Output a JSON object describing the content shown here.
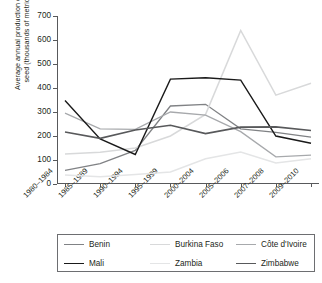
{
  "chart_data": {
    "type": "line",
    "title": "",
    "xlabel": "",
    "ylabel": "Average annual production of cotton\nseed (thousands of metric tons)",
    "ylim": [
      0,
      700
    ],
    "yticks": [
      0,
      100,
      200,
      300,
      400,
      500,
      600,
      700
    ],
    "grid": false,
    "legend_position": "below",
    "categories": [
      "1980–1984",
      "1985–1989",
      "1990–1994",
      "1995–1999",
      "2000–2004",
      "2005–2006",
      "2007–2008",
      "2009–2010"
    ],
    "series": [
      {
        "name": "Benin",
        "color": "#808285",
        "width": 1.3,
        "values": [
          57,
          85,
          140,
          325,
          332,
          230,
          215,
          195
        ]
      },
      {
        "name": "Burkina Faso",
        "color": "#d8d9da",
        "width": 1.5,
        "values": [
          125,
          132,
          150,
          200,
          290,
          640,
          370,
          420
        ]
      },
      {
        "name": "Côte d'Ivoire",
        "color": "#a7a9ac",
        "width": 1.3,
        "values": [
          295,
          230,
          228,
          300,
          287,
          218,
          113,
          120
        ]
      },
      {
        "name": "Mali",
        "color": "#1a1a1a",
        "width": 1.4,
        "values": [
          348,
          188,
          123,
          437,
          443,
          433,
          200,
          170
        ]
      },
      {
        "name": "Zambia",
        "color": "#e4e5e6",
        "width": 1.5,
        "values": [
          37,
          30,
          40,
          50,
          105,
          133,
          88,
          105
        ]
      },
      {
        "name": "Zimbabwe",
        "color": "#58595b",
        "width": 1.6,
        "values": [
          217,
          190,
          225,
          245,
          210,
          237,
          238,
          223
        ]
      }
    ]
  },
  "legend": {
    "rows": [
      [
        "Benin",
        "Burkina Faso",
        "Côte d'Ivoire"
      ],
      [
        "Mali",
        "Zambia",
        "Zimbabwe"
      ]
    ]
  },
  "colors": {
    "axis": "#58595b",
    "text": "#231f20",
    "background": "#ffffff",
    "legend_border": "#6d6e71"
  }
}
